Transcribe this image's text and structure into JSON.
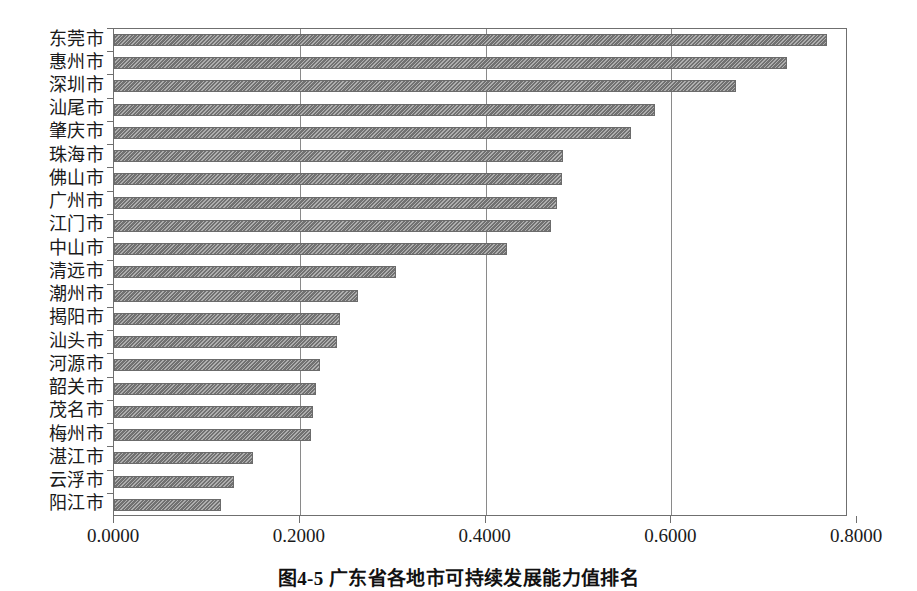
{
  "chart_data": {
    "type": "bar",
    "orientation": "horizontal",
    "title": "",
    "subtitle": "",
    "xlabel": "",
    "ylabel": "",
    "xlim": [
      0.0,
      0.8
    ],
    "ylim": null,
    "grid": true,
    "grid_axis": "x",
    "legend": false,
    "legend_position": "none",
    "bar_color": "#7e7e7e",
    "bar_pattern": "diagonal-hatch",
    "axis_color": "#6f6f6f",
    "tick_labels": [
      "0.0000",
      "0.2000",
      "0.4000",
      "0.6000",
      "0.8000"
    ],
    "tick_values": [
      0.0,
      0.2,
      0.4,
      0.6,
      0.8
    ],
    "categories": [
      "东莞市",
      "惠州市",
      "深圳市",
      "汕尾市",
      "肇庆市",
      "珠海市",
      "佛山市",
      "广州市",
      "江门市",
      "中山市",
      "清远市",
      "潮州市",
      "揭阳市",
      "汕头市",
      "河源市",
      "韶关市",
      "茂名市",
      "梅州市",
      "湛江市",
      "云浮市",
      "阳江市"
    ],
    "values": [
      0.768,
      0.725,
      0.67,
      0.583,
      0.557,
      0.483,
      0.482,
      0.477,
      0.47,
      0.423,
      0.304,
      0.263,
      0.243,
      0.24,
      0.222,
      0.217,
      0.214,
      0.212,
      0.15,
      0.129,
      0.115
    ]
  },
  "caption": {
    "text": "图4-5 广东省各地市可持续发展能力值排名"
  }
}
